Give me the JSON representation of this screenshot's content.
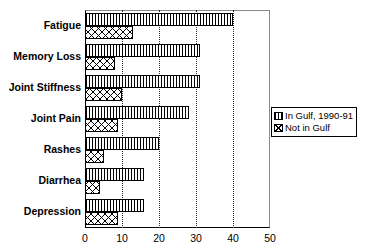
{
  "chart_data": {
    "type": "bar",
    "orientation": "horizontal",
    "title": "",
    "xlabel": "",
    "ylabel": "",
    "xlim": [
      0,
      50
    ],
    "xticks": [
      0,
      10,
      20,
      30,
      40,
      50
    ],
    "grid": "vertical-dotted",
    "legend_position": "right",
    "categories": [
      "Fatigue",
      "Memory Loss",
      "Joint Stiffness",
      "Joint Pain",
      "Rashes",
      "Diarrhea",
      "Depression"
    ],
    "series": [
      {
        "name": "In Gulf, 1990-91",
        "pattern": "vertical-stripes",
        "values": [
          40,
          31,
          31,
          28,
          20,
          16,
          16
        ]
      },
      {
        "name": "Not in Gulf",
        "pattern": "crosshatch",
        "values": [
          13,
          8,
          10,
          9,
          5,
          4,
          9
        ]
      }
    ]
  },
  "legend": {
    "items": [
      {
        "label": "In Gulf, 1990-91"
      },
      {
        "label": "Not in Gulf"
      }
    ]
  }
}
